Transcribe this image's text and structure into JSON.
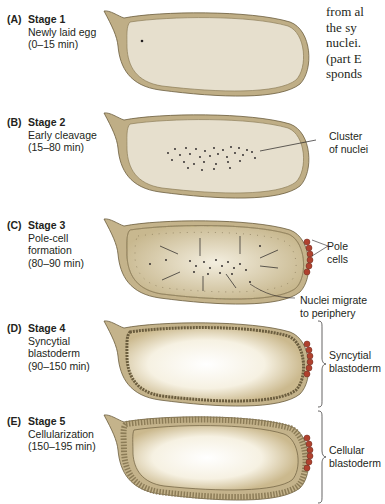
{
  "body_text": {
    "lines": [
      "from al",
      "the sy",
      "nuclei.",
      "(part E",
      "sponds"
    ]
  },
  "panels": [
    {
      "letter": "(A)",
      "title": "Stage 1",
      "lines": [
        "Newly laid egg",
        "(0–15 min)"
      ]
    },
    {
      "letter": "(B)",
      "title": "Stage 2",
      "lines": [
        "Early cleavage",
        "(15–80 min)"
      ],
      "annotation": [
        "Cluster",
        "of nuclei"
      ]
    },
    {
      "letter": "(C)",
      "title": "Stage 3",
      "lines": [
        "Pole-cell",
        "formation",
        "(80–90 min)"
      ],
      "annotation": [
        "Pole",
        "cells"
      ],
      "annotation2": [
        "Nuclei migrate",
        "to periphery"
      ]
    },
    {
      "letter": "(D)",
      "title": "Stage 4",
      "lines": [
        "Syncytial",
        "blastoderm",
        "(90–150 min)"
      ],
      "annotation": [
        "Syncytial",
        "blastoderm"
      ]
    },
    {
      "letter": "(E)",
      "title": "Stage 5",
      "lines": [
        "Cellularization",
        "(150–195 min)"
      ],
      "annotation": [
        "Cellular",
        "blastoderm"
      ]
    }
  ],
  "colors": {
    "shell": "#bfae86",
    "shell_outline": "#6b5d3e",
    "yolk": "#e6dfcd",
    "pole_cells": "#b0412e",
    "nuclei": "#231f20"
  }
}
